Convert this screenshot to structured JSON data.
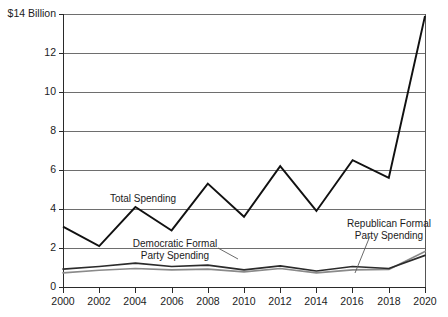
{
  "chart_data": {
    "type": "line",
    "title": "",
    "xlabel": "",
    "ylabel": "$14 Billion",
    "x": [
      2000,
      2002,
      2004,
      2006,
      2008,
      2010,
      2012,
      2014,
      2016,
      2018,
      2020
    ],
    "xtick_labels": [
      "2000",
      "2002",
      "2004",
      "2006",
      "2008",
      "2010",
      "2012",
      "2014",
      "2016",
      "2018",
      "2020"
    ],
    "ytick_labels": [
      "$14 Billion",
      "12",
      "10",
      "8",
      "6",
      "4",
      "2",
      "0"
    ],
    "ytick_values": [
      14,
      12,
      10,
      8,
      6,
      4,
      2,
      0
    ],
    "ylim": [
      0,
      14
    ],
    "xlim": [
      2000,
      2020
    ],
    "grid": true,
    "legend_position": "inline-annotations",
    "units": "Billions of dollars",
    "series": [
      {
        "name": "Total Spending",
        "color": "#111111",
        "values": [
          3.1,
          2.1,
          4.1,
          2.9,
          5.3,
          3.6,
          6.2,
          3.9,
          6.5,
          5.6,
          13.9
        ]
      },
      {
        "name": "Democratic Formal Party Spending",
        "color": "#2b2b2b",
        "values": [
          0.92,
          1.05,
          1.22,
          1.05,
          1.12,
          0.88,
          1.08,
          0.82,
          1.05,
          0.95,
          1.62
        ]
      },
      {
        "name": "Republican Formal Party Spending",
        "color": "#8a8a8a",
        "values": [
          0.72,
          0.86,
          0.95,
          0.88,
          0.92,
          0.78,
          0.95,
          0.72,
          0.88,
          0.9,
          1.82
        ]
      }
    ],
    "annotations": [
      {
        "id": "total-spending",
        "text": "Total Spending",
        "x_px": 143,
        "y_px": 199
      },
      {
        "id": "democratic-formal-party-spending",
        "line1": "Democratic Formal",
        "line2": "Party Spending",
        "x_px": 175,
        "y_px": 244
      },
      {
        "id": "republican-formal-party-spending",
        "line1": "Republican Formal",
        "line2": "Party Spending",
        "x_px": 389,
        "y_px": 224
      }
    ]
  }
}
